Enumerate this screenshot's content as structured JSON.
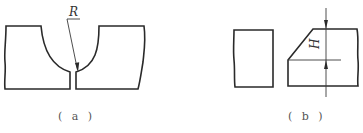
{
  "figure": {
    "panels": [
      {
        "id": "a",
        "caption": "( a )",
        "description": "Two workpiece halves with a U-shaped (radius) groove between them",
        "annotations": [
          {
            "symbol": "R",
            "meaning": "groove root radius",
            "type": "leader-arrow"
          }
        ]
      },
      {
        "id": "b",
        "caption": "( b )",
        "description": "Square-edge plate beside a beveled plate with blunt (root face) height dimension",
        "annotations": [
          {
            "symbol": "H",
            "meaning": "bevel height dimension",
            "type": "dimension-arrows",
            "orientation": "vertical"
          }
        ]
      }
    ]
  },
  "colors": {
    "stroke": "#2a2a2a",
    "caption": "#555555",
    "background": "#ffffff"
  }
}
